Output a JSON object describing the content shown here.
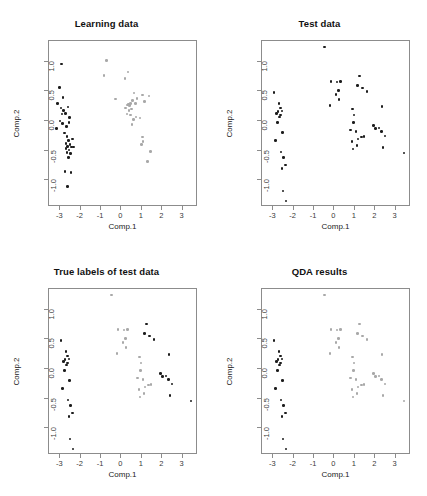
{
  "figure": {
    "layout": "2x2 grid of scatter plots",
    "axis": {
      "xlabel": "Comp.1",
      "ylabel": "Comp.2",
      "xticks": [
        "-3",
        "-2",
        "-1",
        "0",
        "1",
        "2",
        "3"
      ],
      "xtick_values": [
        -3,
        -2,
        -1,
        0,
        1,
        2,
        3
      ],
      "yticks": [
        "1.0",
        "0.5",
        "0.0",
        "-0.5",
        "-1.0"
      ],
      "ytick_values": [
        1.0,
        0.5,
        0.0,
        -0.5,
        -1.0
      ],
      "xlim": [
        -3.55,
        3.75
      ],
      "ylim": [
        -1.45,
        1.35
      ],
      "grid": false
    },
    "colors": {
      "class_a": "#1c1c1c",
      "class_b": "#a8a8a8",
      "frame": "#8c8c8c",
      "background": "#ffffff"
    }
  },
  "chart_data": [
    {
      "type": "scatter",
      "panel": 0,
      "title": "Learning data",
      "xlabel": "Comp.1",
      "ylabel": "Comp.2",
      "xlim": [
        -3.55,
        3.75
      ],
      "ylim": [
        -1.45,
        1.35
      ],
      "grid": false,
      "series": [
        {
          "name": "class-1",
          "color": "#1c1c1c",
          "points": [
            [
              -2.93,
              0.96
            ],
            [
              -3.05,
              0.57
            ],
            [
              -3.12,
              0.3
            ],
            [
              -2.97,
              0.22
            ],
            [
              -2.83,
              0.18
            ],
            [
              -2.74,
              0.13
            ],
            [
              -2.62,
              0.24
            ],
            [
              -2.55,
              0.06
            ],
            [
              -3.02,
              0.0
            ],
            [
              -2.88,
              -0.04
            ],
            [
              -2.7,
              -0.09
            ],
            [
              -2.58,
              -0.02
            ],
            [
              -3.18,
              -0.13
            ],
            [
              -2.8,
              -0.2
            ],
            [
              -2.66,
              -0.26
            ],
            [
              -2.6,
              -0.33
            ],
            [
              -2.72,
              -0.38
            ],
            [
              -2.63,
              -0.43
            ],
            [
              -2.52,
              -0.4
            ],
            [
              -2.45,
              -0.44
            ],
            [
              -2.58,
              -0.49
            ],
            [
              -2.66,
              -0.53
            ],
            [
              -2.71,
              -0.46
            ],
            [
              -2.49,
              -0.55
            ],
            [
              -2.6,
              -0.62
            ],
            [
              -2.41,
              -0.3
            ],
            [
              -2.34,
              -0.44
            ],
            [
              -2.77,
              -0.85
            ],
            [
              -2.48,
              -0.87
            ],
            [
              -2.63,
              -1.1
            ],
            [
              -2.87,
              0.4
            ],
            [
              -2.92,
              0.12
            ]
          ]
        },
        {
          "name": "class-2",
          "color": "#a8a8a8",
          "points": [
            [
              -0.72,
              1.02
            ],
            [
              -0.85,
              0.77
            ],
            [
              0.18,
              0.72
            ],
            [
              0.32,
              0.83
            ],
            [
              -0.3,
              0.37
            ],
            [
              0.62,
              0.47
            ],
            [
              0.77,
              0.38
            ],
            [
              0.45,
              0.3
            ],
            [
              0.35,
              0.29
            ],
            [
              0.3,
              0.27
            ],
            [
              0.4,
              0.26
            ],
            [
              0.55,
              0.35
            ],
            [
              0.7,
              0.3
            ],
            [
              1.02,
              0.44
            ],
            [
              1.35,
              0.42
            ],
            [
              1.14,
              0.33
            ],
            [
              0.28,
              0.12
            ],
            [
              0.45,
              0.1
            ],
            [
              0.58,
              0.03
            ],
            [
              0.72,
              0.07
            ],
            [
              0.9,
              0.05
            ],
            [
              0.52,
              -0.06
            ],
            [
              1.02,
              -0.27
            ],
            [
              1.06,
              -0.35
            ],
            [
              0.98,
              -0.4
            ],
            [
              1.41,
              -0.51
            ],
            [
              1.28,
              -0.68
            ],
            [
              0.2,
              0.22
            ],
            [
              0.48,
              0.2
            ],
            [
              0.36,
              0.18
            ]
          ]
        }
      ]
    },
    {
      "type": "scatter",
      "panel": 1,
      "title": "Test data",
      "xlabel": "Comp.1",
      "ylabel": "Comp.2",
      "xlim": [
        -3.55,
        3.75
      ],
      "ylim": [
        -1.45,
        1.35
      ],
      "grid": false,
      "series": [
        {
          "name": "unlabelled",
          "color": "#1c1c1c",
          "points": [
            [
              -0.48,
              1.25
            ],
            [
              -2.97,
              0.48
            ],
            [
              -2.72,
              0.3
            ],
            [
              -2.63,
              0.22
            ],
            [
              -2.85,
              0.13
            ],
            [
              -2.76,
              0.16
            ],
            [
              -2.65,
              0.1
            ],
            [
              -2.58,
              0.17
            ],
            [
              -2.7,
              0.07
            ],
            [
              -2.8,
              -0.02
            ],
            [
              -2.55,
              -0.19
            ],
            [
              -2.9,
              -0.33
            ],
            [
              -2.62,
              -0.52
            ],
            [
              -2.5,
              -0.62
            ],
            [
              -2.58,
              -0.8
            ],
            [
              -2.4,
              -0.74
            ],
            [
              -2.52,
              -1.18
            ],
            [
              -2.38,
              -1.35
            ],
            [
              -0.16,
              0.67
            ],
            [
              0.12,
              0.66
            ],
            [
              0.3,
              0.67
            ],
            [
              0.2,
              0.52
            ],
            [
              0.08,
              0.45
            ],
            [
              0.22,
              0.36
            ],
            [
              -0.22,
              0.26
            ],
            [
              1.22,
              0.76
            ],
            [
              1.12,
              0.6
            ],
            [
              1.36,
              0.56
            ],
            [
              1.6,
              0.5
            ],
            [
              2.32,
              0.25
            ],
            [
              0.88,
              0.2
            ],
            [
              0.95,
              0.1
            ],
            [
              0.8,
              -0.15
            ],
            [
              0.92,
              -0.02
            ],
            [
              1.05,
              -0.18
            ],
            [
              1.15,
              -0.3
            ],
            [
              1.32,
              -0.27
            ],
            [
              1.45,
              -0.26
            ],
            [
              0.86,
              -0.35
            ],
            [
              0.9,
              -0.47
            ],
            [
              1.1,
              -0.41
            ],
            [
              1.92,
              -0.08
            ],
            [
              2.02,
              -0.13
            ],
            [
              2.18,
              -0.12
            ],
            [
              2.3,
              -0.18
            ],
            [
              2.48,
              -0.25
            ],
            [
              2.38,
              -0.45
            ],
            [
              3.4,
              -0.54
            ]
          ]
        }
      ]
    },
    {
      "type": "scatter",
      "panel": 2,
      "title": "True labels of test data",
      "xlabel": "Comp.1",
      "ylabel": "Comp.2",
      "xlim": [
        -3.55,
        3.75
      ],
      "ylim": [
        -1.45,
        1.35
      ],
      "grid": false,
      "series": [
        {
          "name": "class-1",
          "color": "#1c1c1c",
          "points": [
            [
              -2.97,
              0.48
            ],
            [
              -2.72,
              0.3
            ],
            [
              -2.63,
              0.22
            ],
            [
              -2.85,
              0.13
            ],
            [
              -2.76,
              0.16
            ],
            [
              -2.65,
              0.1
            ],
            [
              -2.58,
              0.17
            ],
            [
              -2.7,
              0.07
            ],
            [
              -2.8,
              -0.02
            ],
            [
              -2.55,
              -0.19
            ],
            [
              -2.9,
              -0.33
            ],
            [
              -2.62,
              -0.52
            ],
            [
              -2.5,
              -0.62
            ],
            [
              -2.58,
              -0.8
            ],
            [
              -2.4,
              -0.74
            ],
            [
              -2.52,
              -1.18
            ],
            [
              -2.38,
              -1.35
            ],
            [
              1.22,
              0.76
            ],
            [
              1.12,
              0.6
            ],
            [
              1.36,
              0.56
            ],
            [
              1.6,
              0.5
            ],
            [
              2.32,
              0.25
            ],
            [
              1.92,
              -0.08
            ],
            [
              2.02,
              -0.13
            ],
            [
              2.18,
              -0.12
            ],
            [
              2.3,
              -0.18
            ],
            [
              2.48,
              -0.25
            ],
            [
              2.38,
              -0.45
            ],
            [
              3.4,
              -0.54
            ]
          ]
        },
        {
          "name": "class-2",
          "color": "#a8a8a8",
          "points": [
            [
              -0.48,
              1.25
            ],
            [
              -0.16,
              0.67
            ],
            [
              0.12,
              0.66
            ],
            [
              0.3,
              0.67
            ],
            [
              0.2,
              0.52
            ],
            [
              0.08,
              0.45
            ],
            [
              0.22,
              0.36
            ],
            [
              -0.22,
              0.26
            ],
            [
              0.88,
              0.2
            ],
            [
              0.95,
              0.1
            ],
            [
              0.8,
              -0.15
            ],
            [
              0.92,
              -0.02
            ],
            [
              1.05,
              -0.18
            ],
            [
              1.15,
              -0.3
            ],
            [
              1.32,
              -0.27
            ],
            [
              1.45,
              -0.26
            ],
            [
              0.86,
              -0.35
            ],
            [
              0.9,
              -0.47
            ],
            [
              1.1,
              -0.41
            ]
          ]
        }
      ]
    },
    {
      "type": "scatter",
      "panel": 3,
      "title": "QDA results",
      "xlabel": "Comp.1",
      "ylabel": "Comp.2",
      "xlim": [
        -3.55,
        3.75
      ],
      "ylim": [
        -1.45,
        1.35
      ],
      "grid": false,
      "series": [
        {
          "name": "predicted-class-1",
          "color": "#1c1c1c",
          "points": [
            [
              -2.97,
              0.48
            ],
            [
              -2.72,
              0.3
            ],
            [
              -2.63,
              0.22
            ],
            [
              -2.85,
              0.13
            ],
            [
              -2.76,
              0.16
            ],
            [
              -2.65,
              0.1
            ],
            [
              -2.58,
              0.17
            ],
            [
              -2.7,
              0.07
            ],
            [
              -2.8,
              -0.02
            ],
            [
              -2.55,
              -0.19
            ],
            [
              -2.9,
              -0.33
            ],
            [
              -2.62,
              -0.52
            ],
            [
              -2.5,
              -0.62
            ],
            [
              -2.58,
              -0.8
            ],
            [
              -2.4,
              -0.74
            ],
            [
              -2.52,
              -1.18
            ],
            [
              -2.38,
              -1.35
            ]
          ]
        },
        {
          "name": "predicted-class-2",
          "color": "#a8a8a8",
          "points": [
            [
              -0.48,
              1.25
            ],
            [
              -0.16,
              0.67
            ],
            [
              0.12,
              0.66
            ],
            [
              0.3,
              0.67
            ],
            [
              0.2,
              0.52
            ],
            [
              0.08,
              0.45
            ],
            [
              0.22,
              0.36
            ],
            [
              -0.22,
              0.26
            ],
            [
              1.22,
              0.76
            ],
            [
              1.12,
              0.6
            ],
            [
              1.36,
              0.56
            ],
            [
              1.6,
              0.5
            ],
            [
              2.32,
              0.25
            ],
            [
              0.88,
              0.2
            ],
            [
              0.95,
              0.1
            ],
            [
              0.8,
              -0.15
            ],
            [
              0.92,
              -0.02
            ],
            [
              1.05,
              -0.18
            ],
            [
              1.15,
              -0.3
            ],
            [
              1.32,
              -0.27
            ],
            [
              1.45,
              -0.26
            ],
            [
              0.86,
              -0.35
            ],
            [
              0.9,
              -0.47
            ],
            [
              1.1,
              -0.41
            ],
            [
              1.92,
              -0.08
            ],
            [
              2.02,
              -0.13
            ],
            [
              2.18,
              -0.12
            ],
            [
              2.3,
              -0.18
            ],
            [
              2.48,
              -0.25
            ],
            [
              2.38,
              -0.45
            ],
            [
              3.4,
              -0.54
            ]
          ]
        }
      ]
    }
  ]
}
